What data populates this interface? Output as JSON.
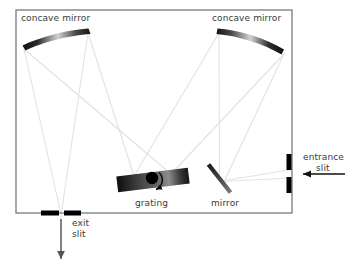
{
  "figure": {
    "type": "optical-diagram",
    "background_color": "#ffffff",
    "enclosure": {
      "name": "instrument housing",
      "x": 16,
      "y": 10,
      "width": 276,
      "height": 203,
      "stroke_color": "#6e6e6e",
      "stroke_width": 1.2
    }
  },
  "labels": {
    "concave_mirror_left": "concave mirror",
    "concave_mirror_right": "concave mirror",
    "grating": "grating",
    "mirror": "mirror",
    "entrance_slit_line1": "entrance",
    "entrance_slit_line2": "slit",
    "exit_slit_line1": "exit",
    "exit_slit_line2": "slit"
  },
  "label_positions": {
    "concave_mirror_left": {
      "x": 21,
      "y": 21
    },
    "concave_mirror_right": {
      "x": 212,
      "y": 21
    },
    "grating": {
      "x": 135,
      "y": 206
    },
    "mirror": {
      "x": 211,
      "y": 206
    },
    "entrance_slit_line1": {
      "x": 303,
      "y": 160
    },
    "entrance_slit_line2": {
      "x": 315,
      "y": 171
    },
    "exit_slit_line1": {
      "x": 72,
      "y": 226
    },
    "exit_slit_line2": {
      "x": 72,
      "y": 237
    }
  },
  "components": {
    "concave_mirror_left": {
      "name": "concave mirror left",
      "x1": 22,
      "y1": 47,
      "x2": 90,
      "y2": 30,
      "gradient": [
        "#111111",
        "#d8d8d8",
        "#111111"
      ]
    },
    "concave_mirror_right": {
      "name": "concave mirror right",
      "x1": 217,
      "y1": 30,
      "x2": 286,
      "y2": 52,
      "gradient": [
        "#111111",
        "#d8d8d8",
        "#111111"
      ]
    },
    "grating": {
      "name": "diffraction grating",
      "center_x": 153,
      "center_y": 180,
      "width": 72,
      "height": 14,
      "rotation_deg": -7,
      "gradient": [
        "#0d0d0d",
        "#4a4a4a",
        "#8a8a8a",
        "#1a1a1a"
      ],
      "pivot_x": 153,
      "pivot_y": 178,
      "pivot_radius": 6,
      "pivot_color": "#000000",
      "rotation_arrow": true
    },
    "plane_mirror": {
      "name": "plane folding mirror",
      "x1": 208,
      "y1": 164,
      "x2": 231,
      "y2": 193,
      "thickness": 4,
      "gradient": [
        "#1c1c1c",
        "#6b6b6b"
      ]
    },
    "entrance_slit": {
      "name": "entrance slit",
      "x": 289,
      "bar_top": {
        "y1": 154,
        "y2": 170
      },
      "bar_bottom": {
        "y1": 177,
        "y2": 193
      },
      "bar_width": 5,
      "color": "#000000",
      "gap_center_y": 173.5
    },
    "exit_slit": {
      "name": "exit slit",
      "y": 213,
      "bar_left": {
        "x1": 41,
        "x2": 59
      },
      "bar_right": {
        "x1": 64,
        "x2": 81
      },
      "bar_height": 5,
      "color": "#000000",
      "gap_center_x": 61.5
    },
    "input_arrow": {
      "name": "input beam arrow",
      "from_x": 345,
      "from_y": 174,
      "to_x": 300,
      "to_y": 174,
      "color": "#111111"
    },
    "output_arrow": {
      "name": "output beam arrow",
      "from_x": 61,
      "from_y": 218,
      "to_x": 61,
      "to_y": 262,
      "color": "#555555"
    }
  },
  "ray_paths": {
    "color": "#e2e2e2",
    "stroke_width": 1.1,
    "description": "light enters the entrance slit, reflects off the plane mirror to the right concave collimating mirror, travels to the grating, disperses to the left concave focusing mirror, and converges on the exit slit",
    "segments": [
      {
        "name": "entrance-to-plane-mirror-upper",
        "x1": 292,
        "y1": 170,
        "x2": 222,
        "y2": 181
      },
      {
        "name": "entrance-to-plane-mirror-lower",
        "x1": 292,
        "y1": 178,
        "x2": 222,
        "y2": 181
      },
      {
        "name": "plane-mirror-to-right-mirror-upper",
        "x1": 219,
        "y1": 178,
        "x2": 219,
        "y2": 32
      },
      {
        "name": "plane-mirror-to-right-mirror-lower",
        "x1": 224,
        "y1": 184,
        "x2": 284,
        "y2": 54
      },
      {
        "name": "right-mirror-to-grating-upper",
        "x1": 219,
        "y1": 32,
        "x2": 133,
        "y2": 176
      },
      {
        "name": "right-mirror-to-grating-lower",
        "x1": 284,
        "y1": 54,
        "x2": 172,
        "y2": 174
      },
      {
        "name": "grating-to-left-mirror-upper",
        "x1": 133,
        "y1": 176,
        "x2": 88,
        "y2": 32
      },
      {
        "name": "grating-to-left-mirror-lower",
        "x1": 172,
        "y1": 174,
        "x2": 24,
        "y2": 49
      },
      {
        "name": "left-mirror-to-exit-slit-upper",
        "x1": 24,
        "y1": 49,
        "x2": 61,
        "y2": 212
      },
      {
        "name": "left-mirror-to-exit-slit-lower",
        "x1": 88,
        "y1": 32,
        "x2": 61,
        "y2": 212
      },
      {
        "name": "exit-beam",
        "x1": 61,
        "y1": 214,
        "x2": 61,
        "y2": 256
      }
    ]
  },
  "colors": {
    "ray": "#e2e2e2",
    "housing_stroke": "#6e6e6e",
    "label_text": "#3a3a3a",
    "component_dark": "#111111",
    "component_light": "#d8d8d8"
  }
}
